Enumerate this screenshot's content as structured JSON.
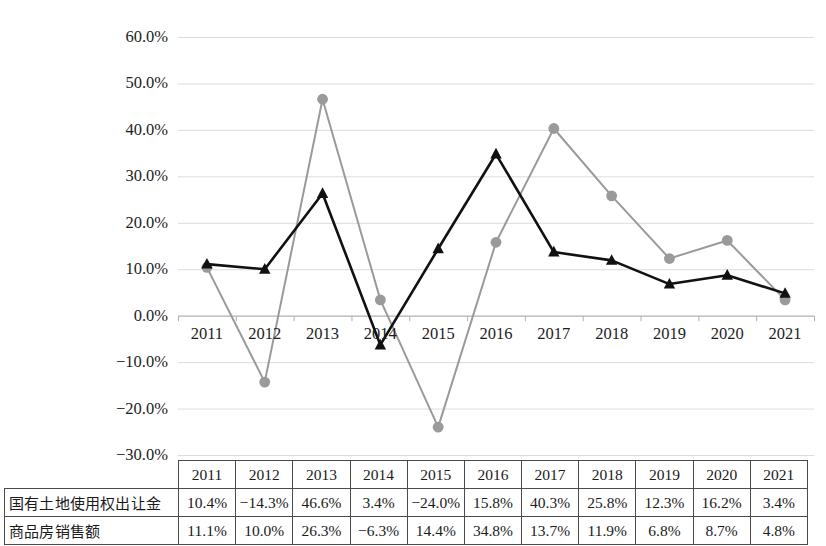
{
  "chart_data": {
    "type": "line",
    "title": "",
    "xlabel": "",
    "ylabel": "",
    "categories": [
      "2011",
      "2012",
      "2013",
      "2014",
      "2015",
      "2016",
      "2017",
      "2018",
      "2019",
      "2020",
      "2021"
    ],
    "ylim": [
      -30,
      60
    ],
    "ytick_step": 10,
    "ytick_labels": [
      "60.0%",
      "50.0%",
      "40.0%",
      "30.0%",
      "20.0%",
      "10.0%",
      "0.0%",
      "−10.0%",
      "−20.0%",
      "−30.0%"
    ],
    "ytick_values": [
      60,
      50,
      40,
      30,
      20,
      10,
      0,
      -10,
      -20,
      -30
    ],
    "grid": true,
    "legend_position": "none",
    "series": [
      {
        "name": "国有土地使用权出让金",
        "marker": "circle",
        "color": "#9a9a9a",
        "values": [
          10.4,
          -14.3,
          46.6,
          3.4,
          -24.0,
          15.8,
          40.3,
          25.8,
          12.3,
          16.2,
          3.4
        ],
        "labels": [
          "10.4%",
          "−14.3%",
          "46.6%",
          "3.4%",
          "−24.0%",
          "15.8%",
          "40.3%",
          "25.8%",
          "12.3%",
          "16.2%",
          "3.4%"
        ]
      },
      {
        "name": "商品房销售额",
        "marker": "triangle",
        "color": "#111111",
        "values": [
          11.1,
          10.0,
          26.3,
          -6.3,
          14.4,
          34.8,
          13.7,
          11.9,
          6.8,
          8.7,
          4.8
        ],
        "labels": [
          "11.1%",
          "10.0%",
          "26.3%",
          "−6.3%",
          "14.4%",
          "34.8%",
          "13.7%",
          "11.9%",
          "6.8%",
          "8.7%",
          "4.8%"
        ]
      }
    ]
  },
  "table": {
    "corner_label": "",
    "header_row": [
      "2011",
      "2012",
      "2013",
      "2014",
      "2015",
      "2016",
      "2017",
      "2018",
      "2019",
      "2020",
      "2021"
    ],
    "rows": [
      {
        "label": "国有土地使用权出让金",
        "cells": [
          "10.4%",
          "−14.3%",
          "46.6%",
          "3.4%",
          "−24.0%",
          "15.8%",
          "40.3%",
          "25.8%",
          "12.3%",
          "16.2%",
          "3.4%"
        ]
      },
      {
        "label": "商品房销售额",
        "cells": [
          "11.1%",
          "10.0%",
          "26.3%",
          "−6.3%",
          "14.4%",
          "34.8%",
          "13.7%",
          "11.9%",
          "6.8%",
          "8.7%",
          "4.8%"
        ]
      }
    ]
  },
  "colors": {
    "series_land": "#9a9a9a",
    "series_housing": "#111111",
    "gridline": "#dcdcdc",
    "axis": "#b0b0b0",
    "table_border": "#4a4a4a",
    "text": "#1a1a1a"
  }
}
